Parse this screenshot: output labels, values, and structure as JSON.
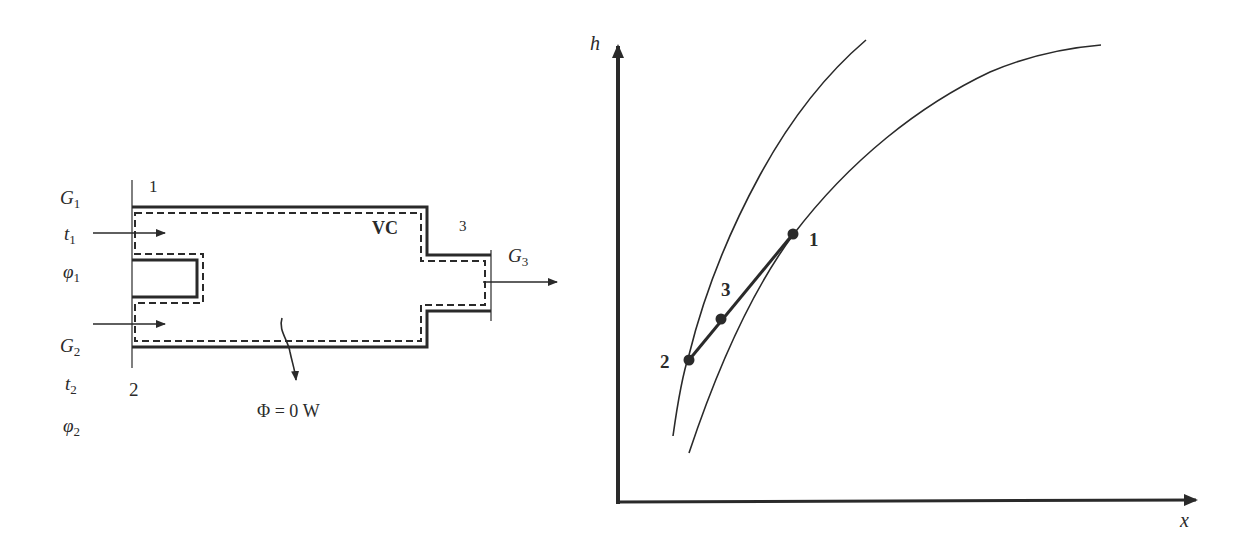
{
  "left_schematic": {
    "inlet1": {
      "section": "1",
      "flow": {
        "base": "G",
        "sub": "1"
      },
      "temperature": {
        "base": "t",
        "sub": "1"
      },
      "humidity": {
        "base": "φ",
        "sub": "1"
      }
    },
    "inlet2": {
      "section": "2",
      "flow": {
        "base": "G",
        "sub": "2"
      },
      "temperature": {
        "base": "t",
        "sub": "2"
      },
      "humidity": {
        "base": "φ",
        "sub": "2"
      }
    },
    "outlet3": {
      "section": "3",
      "flow": {
        "base": "G",
        "sub": "3"
      }
    },
    "control_volume_label": "VC",
    "heat_flow_label": "Φ = 0 W"
  },
  "hx_chart": {
    "y_axis_label": "h",
    "x_axis_label": "x",
    "points": [
      {
        "label": "1",
        "desc": "state of stream 1"
      },
      {
        "label": "2",
        "desc": "state of stream 2"
      },
      {
        "label": "3",
        "desc": "mixed state"
      }
    ],
    "curves": [
      "left curve (through 2)",
      "right curve (through 1)"
    ]
  },
  "colors": {
    "ink": "#2a2a2a",
    "background": "#ffffff"
  }
}
